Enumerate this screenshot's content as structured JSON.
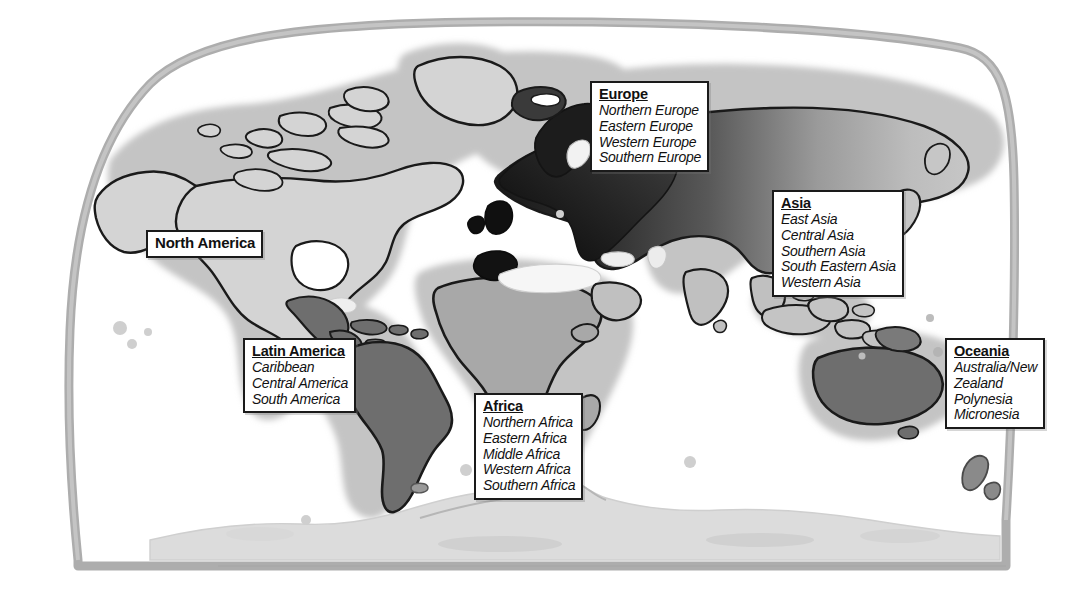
{
  "map": {
    "title": "World map of major regions and sub-regions",
    "projection_outline_color": "#a8a8a8",
    "background_color": "#ffffff",
    "coastline_color": "#1a1a1a",
    "shading": {
      "north_america": "#d2d2d2",
      "latin_america": "#6e6e6e",
      "europe": "#1e1e1e",
      "asia": "#c0c0c0",
      "africa": "#a8a8a8",
      "oceania": "#6e6e6e",
      "antarctica": "#dcdcdc",
      "halo": "#c9c9c9"
    }
  },
  "labels": {
    "north_america": {
      "title": "North America",
      "subregions": []
    },
    "latin_america": {
      "title": "Latin America",
      "subregions": [
        "Caribbean",
        "Central America",
        "South America"
      ]
    },
    "europe": {
      "title": "Europe",
      "subregions": [
        "Northern Europe",
        "Eastern Europe",
        "Western Europe",
        "Southern Europe"
      ]
    },
    "asia": {
      "title": "Asia",
      "subregions": [
        "East Asia",
        "Central Asia",
        "Southern Asia",
        "South Eastern Asia",
        "Western Asia"
      ]
    },
    "africa": {
      "title": "Africa",
      "subregions": [
        "Northern Africa",
        "Eastern Africa",
        "Middle Africa",
        "Western Africa",
        "Southern Africa"
      ]
    },
    "oceania": {
      "title": "Oceania",
      "subregions": [
        "Australia/New",
        "Zealand",
        "Polynesia",
        "Micronesia"
      ]
    }
  }
}
